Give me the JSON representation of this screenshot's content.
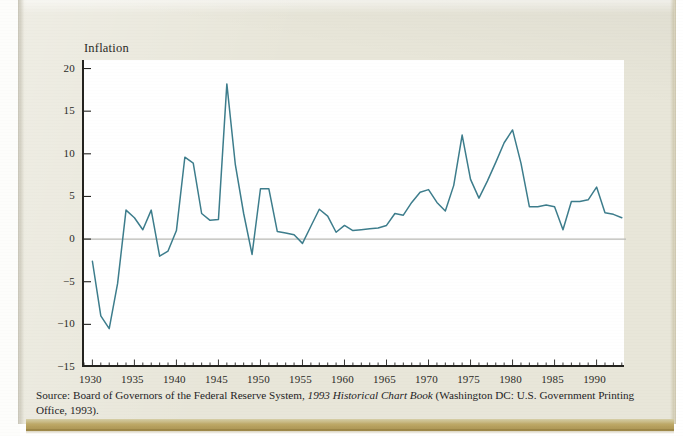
{
  "figure": {
    "y_axis_title_line1": "Inflation",
    "y_axis_title_line2": "Rate (%)",
    "source_prefix": "Source: Board of Governors of the Federal Reserve System, ",
    "source_italic": "1993 Historical Chart Book",
    "source_suffix": " (Washington DC: U.S. Government Printing Office, 1993)."
  },
  "chart_data": {
    "type": "line",
    "title": "",
    "xlabel": "",
    "ylabel": "Inflation Rate (%)",
    "xlim": [
      1929,
      1993.5
    ],
    "ylim": [
      -15,
      21
    ],
    "yticks": [
      20,
      15,
      10,
      5,
      0,
      -5,
      -10,
      -15
    ],
    "ytick_labels": [
      "20",
      "15",
      "10",
      "5",
      "0",
      "−5",
      "−10",
      "−15"
    ],
    "xticks": [
      1930,
      1935,
      1940,
      1945,
      1950,
      1955,
      1960,
      1965,
      1970,
      1975,
      1980,
      1985,
      1990
    ],
    "xtick_labels": [
      "1930",
      "1935",
      "1940",
      "1945",
      "1950",
      "1955",
      "1960",
      "1965",
      "1970",
      "1975",
      "1980",
      "1985",
      "1990"
    ],
    "minor_xtick_interval": 1,
    "grid": false,
    "zero_line": true,
    "legend": "none",
    "line_color": "#3d7d8c",
    "axis_color": "#24231f",
    "zero_line_color": "#b9b9b4",
    "plot_background": "#ffffff",
    "page_background": "#e8e6d9",
    "x": [
      1930,
      1931,
      1932,
      1933,
      1934,
      1935,
      1936,
      1937,
      1938,
      1939,
      1940,
      1941,
      1942,
      1943,
      1944,
      1945,
      1946,
      1947,
      1948,
      1949,
      1950,
      1951,
      1952,
      1953,
      1954,
      1955,
      1956,
      1957,
      1958,
      1959,
      1960,
      1961,
      1962,
      1963,
      1964,
      1965,
      1966,
      1967,
      1968,
      1969,
      1970,
      1971,
      1972,
      1973,
      1974,
      1975,
      1976,
      1977,
      1978,
      1979,
      1980,
      1981,
      1982,
      1983,
      1984,
      1985,
      1986,
      1987,
      1988,
      1989,
      1990,
      1991,
      1992,
      1993
    ],
    "values": [
      -2.6,
      -9.0,
      -10.5,
      -5.2,
      3.4,
      2.5,
      1.1,
      3.4,
      -2.0,
      -1.4,
      1.0,
      9.6,
      8.9,
      3.0,
      2.2,
      2.3,
      18.2,
      8.8,
      3.0,
      -1.8,
      5.9,
      5.9,
      0.9,
      0.7,
      0.5,
      -0.5,
      1.5,
      3.5,
      2.7,
      0.8,
      1.6,
      1.0,
      1.1,
      1.2,
      1.3,
      1.6,
      3.0,
      2.8,
      4.3,
      5.5,
      5.8,
      4.3,
      3.3,
      6.3,
      12.2,
      7.0,
      4.8,
      6.8,
      9.0,
      11.3,
      12.8,
      8.9,
      3.8,
      3.8,
      4.0,
      3.8,
      1.1,
      4.4,
      4.4,
      4.6,
      6.1,
      3.1,
      2.9,
      2.5
    ]
  }
}
